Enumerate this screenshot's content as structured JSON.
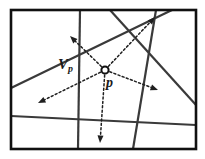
{
  "figure": {
    "caption_labels": {
      "cell_label": "V",
      "cell_label_subscript": "p",
      "point_label": "p"
    },
    "colors": {
      "background": "#ffffff",
      "frame": "#111111",
      "line": "#3a3a3a",
      "ray": "#1f1f1f",
      "label": "#1a1a1a",
      "point_fill": "#ffffff",
      "point_stroke": "#111111"
    },
    "frame": {
      "x": 11,
      "y": 10,
      "width": 185,
      "height": 139,
      "stroke_width": 2.6
    },
    "point": {
      "name": "p",
      "x": 105,
      "y": 70,
      "radius": 3.6,
      "stroke_width": 2.0
    },
    "lines": [
      {
        "name": "line-left-steep",
        "x1": 80,
        "y1": 10,
        "x2": 78,
        "y2": 149,
        "width": 2.2
      },
      {
        "name": "line-top-right-fan",
        "x1": 110,
        "y1": 10,
        "x2": 196,
        "y2": 105,
        "width": 2.2
      },
      {
        "name": "line-diagonal-rise",
        "x1": 11,
        "y1": 88,
        "x2": 172,
        "y2": 10,
        "width": 2.2
      },
      {
        "name": "line-right-steep",
        "x1": 156,
        "y1": 10,
        "x2": 133,
        "y2": 149,
        "width": 2.2
      },
      {
        "name": "line-near-horizontal",
        "x1": 11,
        "y1": 116,
        "x2": 196,
        "y2": 125,
        "width": 2.2
      }
    ],
    "rays": [
      {
        "name": "ray-upper-left",
        "x2": 70,
        "y2": 36,
        "width": 1.5
      },
      {
        "name": "ray-upper-right",
        "x2": 155,
        "y2": 17,
        "width": 1.5
      },
      {
        "name": "ray-lower-left",
        "x2": 38,
        "y2": 103,
        "width": 1.5
      },
      {
        "name": "ray-right",
        "x2": 158,
        "y2": 90,
        "width": 1.5
      },
      {
        "name": "ray-down",
        "x2": 100,
        "y2": 143,
        "width": 1.5
      }
    ],
    "ray_style": {
      "dash_pattern": "2,2.4",
      "arrow_length": 7.5,
      "arrow_half_width": 3.0
    }
  }
}
